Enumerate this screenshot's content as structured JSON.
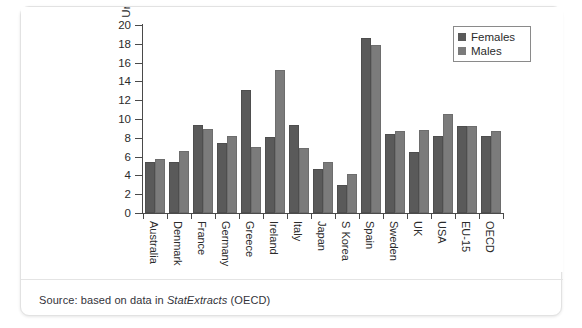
{
  "figure": {
    "source_prefix": "Source: based on data in",
    "source_italic": "StatExtracts",
    "source_suffix": "(OECD)"
  },
  "legend": {
    "position": "top-right",
    "entries": [
      {
        "label": "Females",
        "color": "#5a5a5a",
        "swatch": "square-swatch"
      },
      {
        "label": "Males",
        "color": "#7b7b7b",
        "swatch": "square-swatch"
      }
    ]
  },
  "chart_data": {
    "type": "bar",
    "title": "",
    "subtitle": "",
    "xlabel": "",
    "ylabel": "Unemployed as % of workforce",
    "ylim": [
      0,
      20
    ],
    "yticks": [
      0,
      2,
      4,
      6,
      8,
      10,
      12,
      14,
      16,
      18,
      20
    ],
    "ytick_labels": [
      "0",
      "2",
      "4",
      "6",
      "8",
      "10",
      "12",
      "14",
      "16",
      "18",
      "20"
    ],
    "grid": false,
    "legend_position": "top-right",
    "categories": [
      "Australia",
      "Denmark",
      "France",
      "Germany",
      "Greece",
      "Ireland",
      "Italy",
      "Japan",
      "S Korea",
      "Spain",
      "Sweden",
      "UK",
      "USA",
      "EU-15",
      "OECD"
    ],
    "series": [
      {
        "name": "Females",
        "color": "#5a5a5a",
        "values": [
          5.4,
          5.4,
          9.4,
          7.4,
          13.1,
          8.1,
          9.4,
          4.7,
          3.0,
          18.6,
          8.4,
          6.5,
          8.2,
          9.3,
          8.2
        ]
      },
      {
        "name": "Males",
        "color": "#7b7b7b",
        "values": [
          5.7,
          6.6,
          8.9,
          8.2,
          7.0,
          15.2,
          6.9,
          5.4,
          4.1,
          17.9,
          8.7,
          8.8,
          10.5,
          9.3,
          8.7
        ]
      }
    ]
  }
}
